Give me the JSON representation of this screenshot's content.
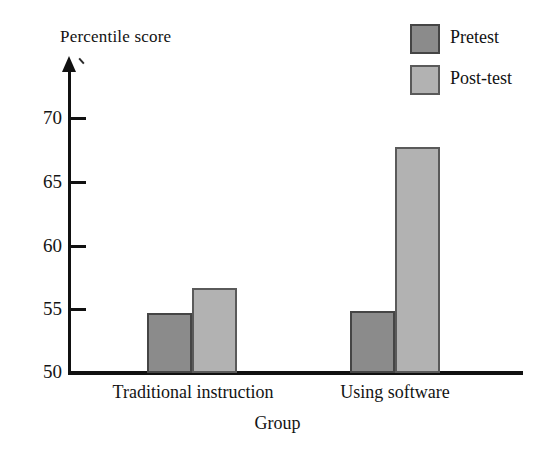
{
  "chart_data": {
    "type": "bar",
    "title": "",
    "ylabel": "Percentile score",
    "xlabel": "Group",
    "categories": [
      "Traditional instruction",
      "Using software"
    ],
    "series": [
      {
        "name": "Pretest",
        "color": "#8b8b8b",
        "values": [
          54.7,
          54.9
        ]
      },
      {
        "name": "Post-test",
        "color": "#b2b2b2",
        "values": [
          56.7,
          67.8
        ]
      }
    ],
    "ylim": [
      50,
      72
    ],
    "yticks": [
      50,
      55,
      60,
      65,
      70
    ],
    "ytick_labels": [
      "50",
      "55",
      "60",
      "65",
      "70"
    ],
    "grid": false,
    "legend_position": "top-right",
    "axis_arrow": "up"
  },
  "axes": {
    "y_title": "Percentile score",
    "x_title": "Group"
  },
  "ticks": {
    "t0": "50",
    "t1": "55",
    "t2": "60",
    "t3": "65",
    "t4": "70"
  },
  "categories": {
    "c0": "Traditional instruction",
    "c1": "Using software"
  },
  "legend": {
    "items": [
      {
        "label": "Pretest"
      },
      {
        "label": "Post-test"
      }
    ]
  }
}
